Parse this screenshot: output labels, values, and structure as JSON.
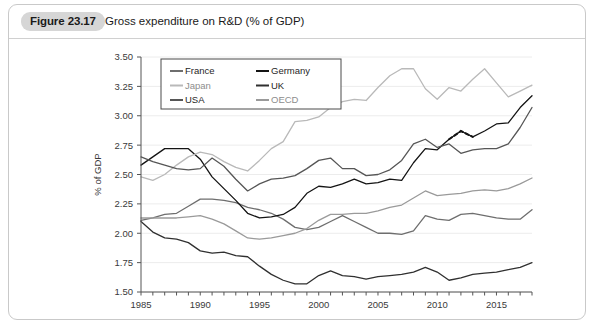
{
  "figure": {
    "badge": "Figure 23.17",
    "title": "Gross expenditure on R&D (% of GDP)"
  },
  "colors": {
    "france": "#6e6e6e",
    "germany": "#141414",
    "japan": "#b9b9b9",
    "uk": "#303030",
    "usa": "#565656",
    "oecd": "#9a9a9a",
    "grid": "#ececec",
    "axis": "#555555",
    "badge_bg": "#d6d6d6",
    "card_border": "#c9c9c9"
  },
  "legend": {
    "position": "top-left-inside",
    "entries": [
      {
        "label": "France",
        "color_key": "france"
      },
      {
        "label": "Germany",
        "color_key": "germany"
      },
      {
        "label": "Japan",
        "color_key": "japan"
      },
      {
        "label": "UK",
        "color_key": "uk"
      },
      {
        "label": "USA",
        "color_key": "usa"
      },
      {
        "label": "OECD",
        "color_key": "oecd"
      }
    ]
  },
  "chart_data": {
    "type": "line",
    "title": "Gross expenditure on R&D (% of GDP)",
    "xlabel": "",
    "ylabel": "% of GDP",
    "xlim": [
      1985,
      2018
    ],
    "ylim": [
      1.5,
      3.5
    ],
    "ytick_step": 0.25,
    "yticks": [
      "1.50",
      "1.75",
      "2.00",
      "2.25",
      "2.50",
      "2.75",
      "3.00",
      "3.25",
      "3.50"
    ],
    "xticks": [
      "1985",
      "1990",
      "1995",
      "2000",
      "2005",
      "2010",
      "2015"
    ],
    "xtick_minor_step": 1,
    "grid": "horizontal",
    "legend": "inside-top-left",
    "x": [
      1985,
      1986,
      1987,
      1988,
      1989,
      1990,
      1991,
      1992,
      1993,
      1994,
      1995,
      1996,
      1997,
      1998,
      1999,
      2000,
      2001,
      2002,
      2003,
      2004,
      2005,
      2006,
      2007,
      2008,
      2009,
      2010,
      2011,
      2012,
      2013,
      2014,
      2015,
      2016,
      2017,
      2018
    ],
    "series": [
      {
        "name": "France",
        "color_key": "france",
        "values": [
          2.11,
          2.13,
          2.16,
          2.17,
          2.23,
          2.29,
          2.29,
          2.28,
          2.26,
          2.22,
          2.2,
          2.17,
          2.12,
          2.05,
          2.03,
          2.05,
          2.1,
          2.15,
          2.1,
          2.05,
          2.0,
          2.0,
          1.99,
          2.02,
          2.15,
          2.12,
          2.11,
          2.16,
          2.17,
          2.15,
          2.13,
          2.12,
          2.12,
          2.2
        ]
      },
      {
        "name": "Germany",
        "color_key": "germany",
        "values": [
          2.58,
          2.65,
          2.72,
          2.72,
          2.72,
          2.63,
          2.48,
          2.38,
          2.28,
          2.17,
          2.13,
          2.14,
          2.16,
          2.22,
          2.34,
          2.4,
          2.39,
          2.42,
          2.46,
          2.42,
          2.43,
          2.46,
          2.45,
          2.6,
          2.72,
          2.71,
          2.8,
          2.87,
          2.82,
          2.87,
          2.93,
          2.94,
          3.07,
          3.17
        ],
        "break_segment": {
          "from_year": 2011,
          "to_year": 2013,
          "style": "dashed",
          "values": [
            2.8,
            2.87,
            2.82
          ]
        }
      },
      {
        "name": "Japan",
        "color_key": "japan",
        "values": [
          2.48,
          2.45,
          2.5,
          2.58,
          2.65,
          2.69,
          2.67,
          2.61,
          2.56,
          2.53,
          2.62,
          2.72,
          2.78,
          2.95,
          2.96,
          2.99,
          3.07,
          3.12,
          3.14,
          3.13,
          3.24,
          3.34,
          3.4,
          3.4,
          3.23,
          3.14,
          3.24,
          3.21,
          3.31,
          3.4,
          3.28,
          3.16,
          3.21,
          3.26
        ]
      },
      {
        "name": "UK",
        "color_key": "uk",
        "values": [
          2.1,
          2.01,
          1.96,
          1.95,
          1.92,
          1.85,
          1.83,
          1.84,
          1.81,
          1.8,
          1.72,
          1.65,
          1.6,
          1.57,
          1.57,
          1.64,
          1.68,
          1.64,
          1.63,
          1.61,
          1.63,
          1.64,
          1.65,
          1.67,
          1.71,
          1.67,
          1.6,
          1.62,
          1.65,
          1.66,
          1.67,
          1.69,
          1.71,
          1.75
        ]
      },
      {
        "name": "USA",
        "color_key": "usa",
        "values": [
          2.65,
          2.61,
          2.58,
          2.55,
          2.54,
          2.55,
          2.64,
          2.57,
          2.46,
          2.36,
          2.42,
          2.46,
          2.47,
          2.49,
          2.55,
          2.62,
          2.64,
          2.55,
          2.55,
          2.49,
          2.5,
          2.54,
          2.62,
          2.76,
          2.8,
          2.73,
          2.76,
          2.68,
          2.71,
          2.72,
          2.72,
          2.76,
          2.9,
          3.07
        ]
      },
      {
        "name": "OECD",
        "color_key": "oecd",
        "values": [
          2.13,
          2.13,
          2.13,
          2.13,
          2.14,
          2.15,
          2.12,
          2.08,
          2.02,
          1.96,
          1.95,
          1.96,
          1.98,
          2.0,
          2.04,
          2.11,
          2.16,
          2.16,
          2.17,
          2.17,
          2.19,
          2.22,
          2.24,
          2.3,
          2.36,
          2.32,
          2.33,
          2.34,
          2.36,
          2.37,
          2.36,
          2.38,
          2.42,
          2.47
        ]
      }
    ]
  }
}
